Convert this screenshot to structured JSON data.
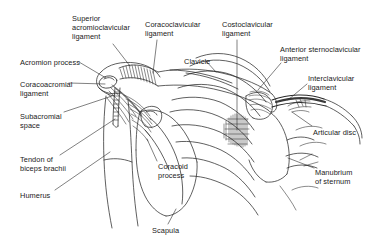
{
  "figure": {
    "style": "black-and-white anatomical line drawing with hatched shading",
    "background_color": "#ffffff",
    "line_color": "#2b2b2b",
    "text_color": "#1a1a1a"
  },
  "labels": [
    {
      "id": "superior-acromioclavicular-ligament",
      "lines": [
        "Superior",
        "acromioclavicular",
        "ligament"
      ],
      "x": 72,
      "y": 14,
      "align": "left",
      "leader": {
        "from": [
          113,
          44
        ],
        "to": [
          130,
          66
        ]
      }
    },
    {
      "id": "coracoclavicular-ligament",
      "lines": [
        "Coracoclavicular",
        "ligament"
      ],
      "x": 145,
      "y": 20,
      "align": "left",
      "leader": {
        "from": [
          157,
          40
        ],
        "to": [
          153,
          73
        ]
      }
    },
    {
      "id": "costoclavicular-ligament",
      "lines": [
        "Costoclavicular",
        "ligament"
      ],
      "x": 222,
      "y": 20,
      "align": "left",
      "leader": {
        "from": [
          237,
          40
        ],
        "to": [
          237,
          130
        ]
      }
    },
    {
      "id": "anterior-sternoclavicular-ligament",
      "lines": [
        "Anterior sternoclavicular",
        "ligament"
      ],
      "x": 280,
      "y": 45,
      "align": "left",
      "leader": {
        "from": [
          281,
          63
        ],
        "to": [
          258,
          90
        ]
      }
    },
    {
      "id": "interclavicular-ligament",
      "lines": [
        "Interclavicular",
        "ligament"
      ],
      "x": 308,
      "y": 74,
      "align": "left",
      "leader": {
        "from": [
          307,
          84
        ],
        "to": [
          288,
          100
        ]
      }
    },
    {
      "id": "clavicle",
      "lines": [
        "Clavicle"
      ],
      "x": 184,
      "y": 57,
      "align": "left",
      "leader": {
        "from": [
          206,
          61
        ],
        "to": [
          216,
          72
        ]
      }
    },
    {
      "id": "acromion-process",
      "lines": [
        "Acromion process"
      ],
      "x": 20,
      "y": 58,
      "align": "left",
      "leader": {
        "from": [
          79,
          62
        ],
        "to": [
          106,
          78
        ]
      }
    },
    {
      "id": "coracoacromial-ligament",
      "lines": [
        "Coracoacromial",
        "ligament"
      ],
      "x": 20,
      "y": 80,
      "align": "left",
      "leader": {
        "from": [
          69,
          83
        ],
        "to": [
          105,
          84
        ]
      }
    },
    {
      "id": "subacromial-space",
      "lines": [
        "Subacromial",
        "space"
      ],
      "x": 20,
      "y": 112,
      "align": "left",
      "leader": {
        "from": [
          64,
          112
        ],
        "to": [
          112,
          96
        ]
      }
    },
    {
      "id": "tendon-of-biceps-brachii",
      "lines": [
        "Tendon of",
        "biceps brachii"
      ],
      "x": 20,
      "y": 155,
      "align": "left",
      "leader": {
        "from": [
          60,
          155
        ],
        "to": [
          115,
          119
        ]
      }
    },
    {
      "id": "humerus",
      "lines": [
        "Humerus"
      ],
      "x": 20,
      "y": 191,
      "align": "left",
      "leader": {
        "from": [
          55,
          190
        ],
        "to": [
          110,
          152
        ]
      }
    },
    {
      "id": "coracoid-process",
      "lines": [
        "Coracoid",
        "process"
      ],
      "x": 158,
      "y": 162,
      "align": "left",
      "leader": {
        "from": [
          157,
          161
        ],
        "to": [
          147,
          139
        ]
      }
    },
    {
      "id": "scapula",
      "lines": [
        "Scapula"
      ],
      "x": 152,
      "y": 226,
      "align": "left",
      "leader": {
        "from": [
          168,
          224
        ],
        "to": [
          176,
          209
        ]
      }
    },
    {
      "id": "articular-disc",
      "lines": [
        "Articular disc"
      ],
      "x": 313,
      "y": 128,
      "align": "left",
      "leader": {
        "from": [
          312,
          126
        ],
        "to": [
          292,
          112
        ]
      }
    },
    {
      "id": "manubrium-of-sternum",
      "lines": [
        "Manubrium",
        "of sternum"
      ],
      "x": 315,
      "y": 168,
      "align": "left",
      "leader": {
        "from": [
          314,
          168
        ],
        "to": [
          288,
          158
        ]
      }
    }
  ]
}
